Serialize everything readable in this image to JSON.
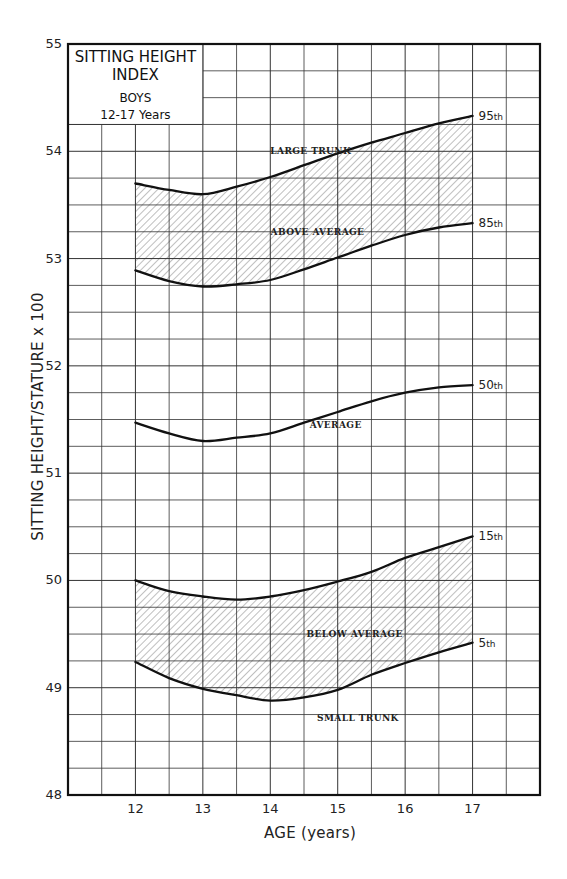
{
  "chart_data": {
    "type": "line",
    "title": "SITTING HEIGHT INDEX",
    "subtitle": [
      "BOYS",
      "12-17 Years"
    ],
    "xlabel": "AGE (years)",
    "ylabel": "SITTING HEIGHT/STATURE x 100",
    "xlim": [
      11,
      18
    ],
    "ylim": [
      48,
      55
    ],
    "x_ticks": [
      12,
      13,
      14,
      15,
      16,
      17
    ],
    "y_ticks": [
      48,
      49,
      50,
      51,
      52,
      53,
      54,
      55
    ],
    "grid": {
      "x_step": 0.5,
      "y_step": 0.25,
      "on": true
    },
    "x": [
      12,
      12.5,
      13,
      13.5,
      14,
      14.5,
      15,
      15.5,
      16,
      16.5,
      17
    ],
    "series": [
      {
        "name": "95th",
        "values": [
          53.7,
          53.64,
          53.6,
          53.67,
          53.76,
          53.87,
          53.98,
          54.08,
          54.17,
          54.26,
          54.33
        ]
      },
      {
        "name": "85th",
        "values": [
          52.89,
          52.79,
          52.74,
          52.76,
          52.8,
          52.9,
          53.01,
          53.12,
          53.22,
          53.29,
          53.33
        ]
      },
      {
        "name": "50th",
        "values": [
          51.47,
          51.37,
          51.3,
          51.33,
          51.37,
          51.47,
          51.57,
          51.67,
          51.75,
          51.8,
          51.82
        ]
      },
      {
        "name": "15th",
        "values": [
          50.0,
          49.9,
          49.85,
          49.82,
          49.85,
          49.91,
          49.99,
          50.08,
          50.21,
          50.31,
          50.41
        ]
      },
      {
        "name": "5th",
        "values": [
          49.24,
          49.09,
          48.99,
          48.93,
          48.88,
          48.91,
          48.98,
          49.12,
          49.23,
          49.33,
          49.42
        ]
      }
    ],
    "shaded_bands": [
      {
        "between": [
          "85th",
          "95th"
        ],
        "pattern": "diagonal-hatch"
      },
      {
        "between": [
          "5th",
          "15th"
        ],
        "pattern": "diagonal-hatch"
      }
    ],
    "annotations": [
      {
        "text": "LARGE TRUNK",
        "x": 14.6,
        "y": 54.0
      },
      {
        "text": "ABOVE AVERAGE",
        "x": 14.7,
        "y": 53.25
      },
      {
        "text": "AVERAGE",
        "x": 14.97,
        "y": 51.45
      },
      {
        "text": "BELOW AVERAGE",
        "x": 15.25,
        "y": 49.5
      },
      {
        "text": "SMALL TRUNK",
        "x": 15.3,
        "y": 48.72
      }
    ],
    "colors": {
      "line": "#111111",
      "grid": "#333333",
      "hatch": "#8a8a8a",
      "background": "#ffffff"
    }
  }
}
